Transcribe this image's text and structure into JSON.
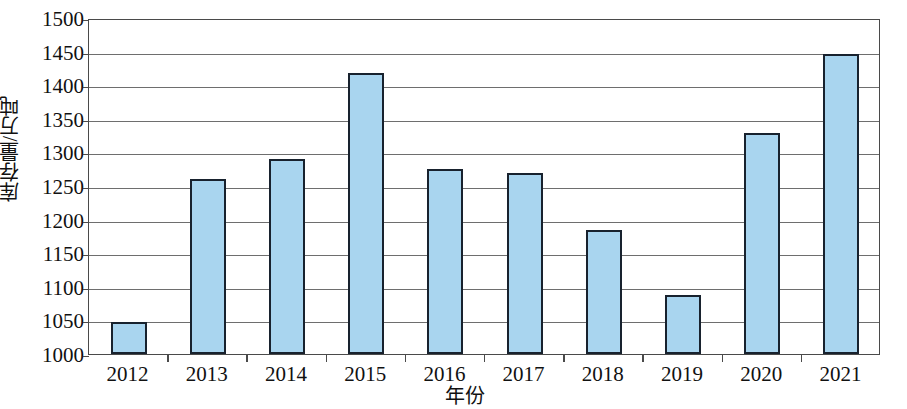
{
  "chart_data": {
    "type": "bar",
    "title": "",
    "subtitle": "",
    "xlabel": "年份",
    "ylabel": "库存量/万吨",
    "categories": [
      "2012",
      "2013",
      "2014",
      "2015",
      "2016",
      "2017",
      "2018",
      "2019",
      "2020",
      "2021"
    ],
    "values": [
      1047,
      1261,
      1290,
      1418,
      1275,
      1270,
      1185,
      1088,
      1329,
      1446
    ],
    "series": [
      {
        "name": "库存量",
        "values": [
          1047,
          1261,
          1290,
          1418,
          1275,
          1270,
          1185,
          1088,
          1329,
          1446
        ]
      }
    ],
    "ylim": [
      1000,
      1500
    ],
    "ytick_step": 50,
    "yticks": [
      1000,
      1050,
      1100,
      1150,
      1200,
      1250,
      1300,
      1350,
      1400,
      1450,
      1500
    ],
    "ytick_labels": [
      "1000",
      "1050",
      "1100",
      "1150",
      "1200",
      "1250",
      "1300",
      "1350",
      "1400",
      "1450",
      "1500"
    ],
    "grid": true,
    "grid_axis": "y",
    "legend": false,
    "legend_position": "none",
    "bar_fill_color": "#a9d5ef",
    "bar_edge_color": "#18222e",
    "gridline_color": "#6e6e6e",
    "axis_color": "#4a4a4a",
    "background_color": "#ffffff",
    "annotations": []
  }
}
